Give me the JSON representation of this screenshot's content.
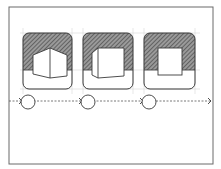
{
  "diagram": {
    "type": "sketch-sequence",
    "colors": {
      "stroke": "#3a3a3a",
      "hatch": "#555555",
      "guide": "#bbbbbb",
      "background": "#ffffff"
    },
    "frame": {
      "x": 9,
      "y": 7,
      "w": 204,
      "h": 157
    },
    "panels": [
      {
        "id": "panel-1",
        "x": 23,
        "y": 33,
        "w": 49,
        "h": 56,
        "object": "cube-front-edge"
      },
      {
        "id": "panel-2",
        "x": 83,
        "y": 33,
        "w": 50,
        "h": 56,
        "object": "cube-rotated"
      },
      {
        "id": "panel-3",
        "x": 144,
        "y": 33,
        "w": 51,
        "h": 56,
        "object": "square-front"
      }
    ],
    "timeline": {
      "y": 101,
      "nodes": [
        {
          "cx": 28,
          "r": 7
        },
        {
          "cx": 88,
          "r": 7
        },
        {
          "cx": 149,
          "r": 7
        }
      ],
      "end_arrow_x": 211
    }
  }
}
